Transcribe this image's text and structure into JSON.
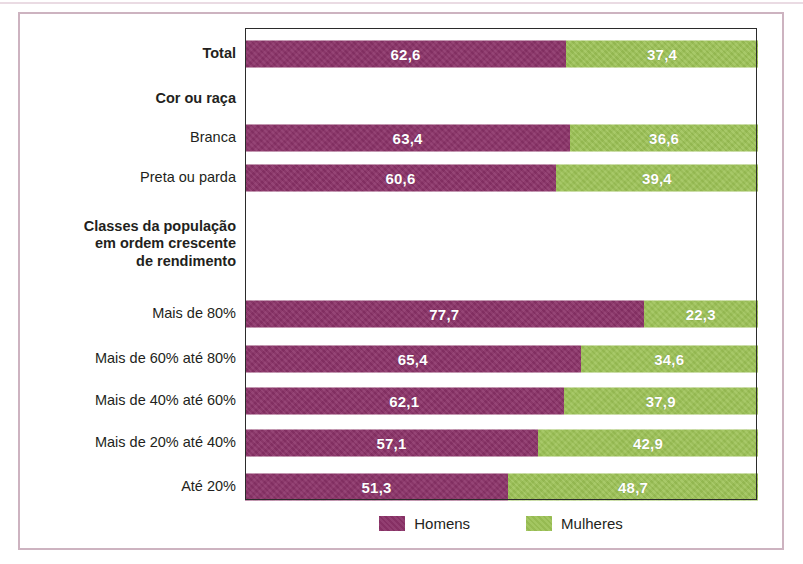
{
  "colors": {
    "men": "#8b3268",
    "women": "#9cc255",
    "frame": "#cdb3c0",
    "plot_border": "#2b2b2b",
    "label_text": "#231f20",
    "value_text": "#ffffff"
  },
  "chart_data": {
    "type": "bar",
    "orientation": "horizontal",
    "stacked": true,
    "normalized_percent": true,
    "title": "",
    "subtitle": "",
    "xlabel": "",
    "ylabel": "",
    "xlim": [
      0,
      100
    ],
    "grid": false,
    "legend_position": "bottom-center",
    "series": [
      {
        "name": "Homens",
        "color": "#8b3268",
        "values": [
          62.6,
          null,
          63.4,
          60.6,
          null,
          77.7,
          65.4,
          62.1,
          57.1,
          51.3
        ]
      },
      {
        "name": "Mulheres",
        "color": "#9cc255",
        "values": [
          37.4,
          null,
          36.6,
          39.4,
          null,
          22.3,
          34.6,
          37.9,
          42.9,
          48.7
        ]
      }
    ],
    "categories": [
      "Total",
      "Cor ou raça",
      "Branca",
      "Preta ou parda",
      "Classes da população em ordem crescente de rendimento",
      "Mais de 80%",
      "Mais de 60% até 80%",
      "Mais de 40% até 60%",
      "Mais de 20% até 40%",
      "Até 20%"
    ],
    "value_labels": {
      "men": [
        "62,6",
        "",
        "63,4",
        "60,6",
        "",
        "77,7",
        "65,4",
        "62,1",
        "57,1",
        "51,3"
      ],
      "women": [
        "37,4",
        "",
        "36,6",
        "39,4",
        "",
        "22,3",
        "34,6",
        "37,9",
        "42,9",
        "48,7"
      ]
    }
  },
  "rows": [
    {
      "id": "total",
      "label": "Total",
      "bold": true,
      "is_header": false,
      "men": 62.6,
      "women": 37.4,
      "men_label": "62,6",
      "women_label": "37,4",
      "height": 52
    },
    {
      "id": "cor-ou-raca",
      "label": "Cor ou raça",
      "bold": true,
      "is_header": true,
      "men": null,
      "women": null,
      "men_label": "",
      "women_label": "",
      "height": 38
    },
    {
      "id": "branca",
      "label": "Branca",
      "bold": false,
      "is_header": false,
      "men": 63.4,
      "women": 36.6,
      "men_label": "63,4",
      "women_label": "36,6",
      "height": 40
    },
    {
      "id": "preta-ou-parda",
      "label": "Preta ou parda",
      "bold": false,
      "is_header": false,
      "men": 60.6,
      "women": 39.4,
      "men_label": "60,6",
      "women_label": "39,4",
      "height": 40
    },
    {
      "id": "classes-da-populacao",
      "label": "Classes da população\nem ordem crescente\nde rendimento",
      "bold": true,
      "is_header": true,
      "men": null,
      "women": null,
      "men_label": "",
      "women_label": "",
      "height": 92
    },
    {
      "id": "mais-de-80",
      "label": "Mais de 80%",
      "bold": false,
      "is_header": false,
      "men": 77.7,
      "women": 22.3,
      "men_label": "77,7",
      "women_label": "22,3",
      "height": 48
    },
    {
      "id": "mais-de-60-ate-80",
      "label": "Mais de 60% até 80%",
      "bold": false,
      "is_header": false,
      "men": 65.4,
      "women": 34.6,
      "men_label": "65,4",
      "women_label": "34,6",
      "height": 42
    },
    {
      "id": "mais-de-40-ate-60",
      "label": "Mais de 40% até 60%",
      "bold": false,
      "is_header": false,
      "men": 62.1,
      "women": 37.9,
      "men_label": "62,1",
      "women_label": "37,9",
      "height": 42
    },
    {
      "id": "mais-de-20-ate-40",
      "label": "Mais de 20% até 40%",
      "bold": false,
      "is_header": false,
      "men": 57.1,
      "women": 42.9,
      "men_label": "57,1",
      "women_label": "42,9",
      "height": 42
    },
    {
      "id": "ate-20",
      "label": "Até 20%",
      "bold": false,
      "is_header": false,
      "men": 51.3,
      "women": 48.7,
      "men_label": "51,3",
      "women_label": "48,7",
      "height": 46
    }
  ],
  "legend": {
    "items": [
      {
        "id": "homens",
        "label": "Homens",
        "color": "#8b3268"
      },
      {
        "id": "mulheres",
        "label": "Mulheres",
        "color": "#9cc255"
      }
    ]
  }
}
